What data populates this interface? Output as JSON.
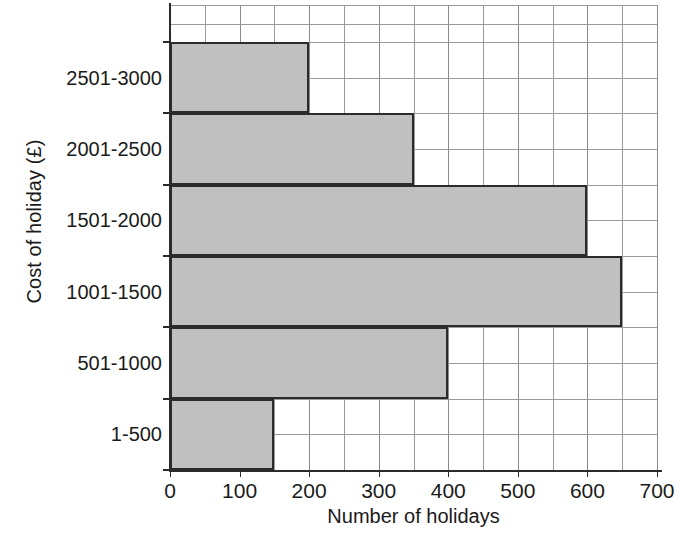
{
  "chart_data": {
    "type": "bar",
    "orientation": "horizontal",
    "title": "",
    "xlabel": "Number of holidays",
    "ylabel": "Cost of holiday (£)",
    "categories": [
      "1-500",
      "501-1000",
      "1001-1500",
      "1501-2000",
      "2001-2500",
      "2501-3000"
    ],
    "values": [
      150,
      400,
      650,
      600,
      350,
      200
    ],
    "xlim": [
      0,
      700
    ],
    "xticks": [
      0,
      100,
      200,
      300,
      400,
      500,
      600,
      700
    ],
    "xtick_labels": [
      "0",
      "100",
      "200",
      "300",
      "400",
      "500",
      "600",
      "700"
    ],
    "minor_gridline_step": 50,
    "grid": true,
    "legend": "none",
    "bar_fill_color": "#c0c0c0",
    "bar_border_color": "#2b2b2b",
    "gridline_color": "#9a9a9a",
    "axis_color": "#2b2b2b",
    "background_color": "#ffffff"
  }
}
